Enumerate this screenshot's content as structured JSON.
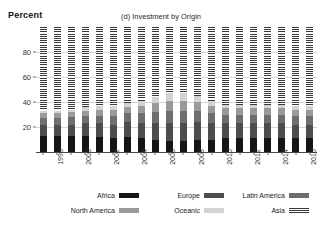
{
  "chart_data": {
    "type": "bar",
    "subtype": "stacked-percentage-bar",
    "title": "(d) Investment by Origin",
    "xlabel": "",
    "ylabel": "Percent",
    "ylim": [
      0,
      100
    ],
    "yticks": [
      20,
      40,
      60,
      80
    ],
    "grid": true,
    "legend_position": "bottom",
    "x": [
      1997,
      1998,
      1999,
      2000,
      2001,
      2002,
      2003,
      2004,
      2005,
      2006,
      2007,
      2008,
      2009,
      2010,
      2011,
      2012,
      2013,
      2014,
      2015,
      2016
    ],
    "xtick_labels": [
      "",
      "1998",
      "",
      "2000",
      "",
      "2002",
      "",
      "2004",
      "",
      "2006",
      "",
      "2008",
      "",
      "2010",
      "",
      "2012",
      "",
      "2014",
      "",
      "2016"
    ],
    "series": [
      {
        "name": "Africa",
        "color": "#151515",
        "pattern": "solid",
        "values": [
          13,
          13,
          13,
          13,
          12,
          11,
          12,
          11,
          10,
          9,
          9,
          10,
          10,
          11,
          11,
          11,
          11,
          11,
          11,
          11
        ]
      },
      {
        "name": "Europe",
        "color": "#4d4d4d",
        "pattern": "solid",
        "values": [
          9,
          9,
          9,
          10,
          11,
          11,
          12,
          12,
          13,
          14,
          14,
          14,
          13,
          12,
          12,
          12,
          12,
          12,
          11,
          11
        ]
      },
      {
        "name": "Latin America",
        "color": "#6e6e6e",
        "pattern": "solid",
        "values": [
          5,
          5,
          6,
          6,
          6,
          7,
          7,
          8,
          9,
          10,
          10,
          9,
          8,
          7,
          7,
          7,
          7,
          7,
          7,
          7
        ]
      },
      {
        "name": "North America",
        "color": "#9a9a9a",
        "pattern": "solid",
        "values": [
          4,
          4,
          4,
          4,
          5,
          5,
          5,
          6,
          7,
          8,
          8,
          7,
          6,
          5,
          5,
          5,
          5,
          5,
          5,
          5
        ]
      },
      {
        "name": "Oceanic",
        "color": "#d3d3d3",
        "pattern": "solid",
        "values": [
          2,
          2,
          2,
          3,
          3,
          3,
          3,
          4,
          5,
          6,
          6,
          5,
          4,
          3,
          3,
          3,
          3,
          3,
          3,
          3
        ]
      },
      {
        "name": "Asia",
        "color": "#3a3a3a",
        "pattern": "vertical-hatch",
        "values": [
          67,
          67,
          66,
          64,
          63,
          63,
          61,
          59,
          56,
          53,
          53,
          55,
          59,
          62,
          62,
          62,
          62,
          62,
          63,
          63
        ]
      }
    ]
  },
  "legend": {
    "rows": [
      [
        {
          "label": "Africa",
          "series": 0
        },
        {
          "label": "Europe",
          "series": 1
        },
        {
          "label": "Latin America",
          "series": 2
        }
      ],
      [
        {
          "label": "North America",
          "series": 3
        },
        {
          "label": "Oceanic",
          "series": 4
        },
        {
          "label": "Asia",
          "series": 5
        }
      ]
    ]
  }
}
